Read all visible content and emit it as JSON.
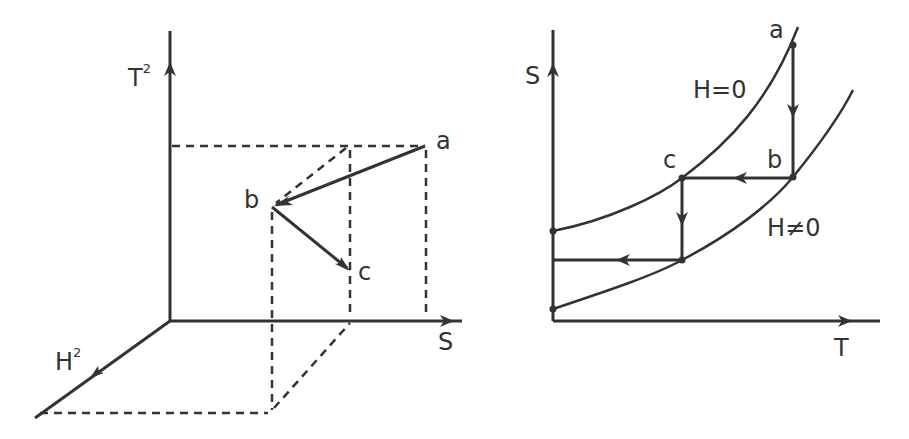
{
  "colors": {
    "ink": "#333333",
    "background": "#ffffff"
  },
  "left_diagram": {
    "axes": {
      "vertical": {
        "label": "T",
        "superscript": "2"
      },
      "horizontal": {
        "label": "S"
      },
      "depth": {
        "label": "H",
        "superscript": "2"
      }
    },
    "points": [
      {
        "label": "a"
      },
      {
        "label": "b"
      },
      {
        "label": "c"
      }
    ],
    "path": [
      "a",
      "b",
      "c"
    ]
  },
  "right_diagram": {
    "axes": {
      "vertical": {
        "label": "S"
      },
      "horizontal": {
        "label": "T"
      }
    },
    "curves": [
      {
        "label": "H=0"
      },
      {
        "label": "H≠0"
      }
    ],
    "points": [
      {
        "label": "a"
      },
      {
        "label": "b"
      },
      {
        "label": "c"
      }
    ],
    "path": [
      "a",
      "b",
      "c"
    ]
  }
}
